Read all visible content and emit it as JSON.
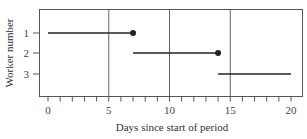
{
  "chart_data": {
    "type": "gantt-segments",
    "title": "",
    "xlabel": "Days since start of period",
    "ylabel": "Worker number",
    "xlim": [
      -0.7,
      20.5
    ],
    "x_ticks": [
      0,
      5,
      10,
      15,
      20
    ],
    "x_tick_labels": [
      "0",
      "5",
      "10",
      "15",
      "20"
    ],
    "x_minor_tick_step": 1,
    "y_categories": [
      "1",
      "2",
      "3"
    ],
    "vertical_gridlines": [
      5,
      10,
      15
    ],
    "series": [
      {
        "worker": "1",
        "start": 0,
        "end": 7,
        "end_marker": "filled-dot"
      },
      {
        "worker": "2",
        "start": 7,
        "end": 14,
        "end_marker": "filled-dot"
      },
      {
        "worker": "3",
        "start": 14,
        "end": 20,
        "end_marker": "none"
      }
    ],
    "colors": {
      "line": "#222222",
      "axis": "#555555",
      "grid": "#666666"
    }
  }
}
